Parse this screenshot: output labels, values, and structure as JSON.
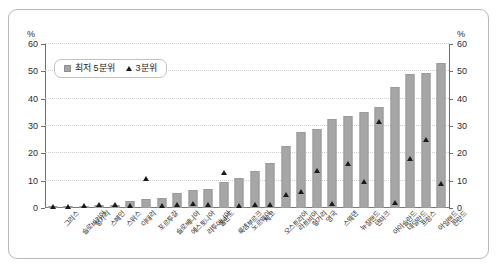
{
  "chart_data": {
    "type": "bar",
    "title": "",
    "xlabel": "",
    "ylabel": "%",
    "ylabel_right": "%",
    "ylim": [
      0,
      60
    ],
    "yticks": [
      0,
      10,
      20,
      30,
      40,
      50,
      60
    ],
    "grid": true,
    "legend_position": "upper-left-inside",
    "categories": [
      "그리스",
      "슬로바키아",
      "헝가리",
      "스페인",
      "스위스",
      "이태리",
      "포르투갈",
      "슬로베니아",
      "에스토니아",
      "리투아니아",
      "폴란드",
      "룩셈부르크",
      "노르웨이",
      "체코",
      "오스트리아",
      "라트비아",
      "헝가리",
      "영국",
      "스웨덴",
      "뉴질랜드",
      "덴마크",
      "아이슬란드",
      "네덜란드",
      "프랑스",
      "아일랜드",
      "핀란드"
    ],
    "series": [
      {
        "name": "최저 5분위",
        "marker": "square",
        "color": "#a6a6a6",
        "values": [
          0.2,
          0.2,
          0.4,
          1.0,
          1.2,
          2.4,
          3.4,
          3.5,
          5.4,
          6.7,
          7.0,
          9.6,
          11.1,
          13.7,
          16.3,
          22.8,
          27.9,
          29.0,
          32.5,
          33.8,
          35.2,
          36.8,
          44.4,
          49.2,
          49.4,
          53.1
        ]
      },
      {
        "name": "3분위",
        "marker": "triangle",
        "color": "#1a1a1a",
        "values": [
          0.0,
          0.1,
          0.3,
          0.7,
          0.9,
          0.5,
          10.2,
          0.2,
          0.6,
          1.1,
          0.6,
          12.4,
          0.3,
          0.9,
          0.8,
          4.4,
          5.4,
          13.0,
          1.1,
          15.9,
          9.3,
          31.1,
          1.4,
          17.5,
          24.6,
          8.6
        ]
      }
    ],
    "legend": [
      {
        "label": "최저 5분위",
        "marker": "square"
      },
      {
        "label": "3분위",
        "marker": "triangle"
      }
    ]
  }
}
